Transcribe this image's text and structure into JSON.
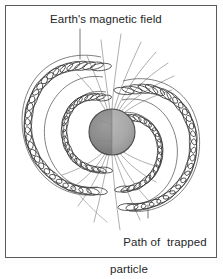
{
  "figure": {
    "title_label": "Earth's magnetic field",
    "path_label_line1": "Path of  trapped",
    "path_label_line2": "particle",
    "colors": {
      "frame": "#5a5a5a",
      "ink": "#3a3a3a",
      "field_line": "#8d8d8d",
      "earth_left": "#878787",
      "earth_right": "#a8a8a8",
      "earth_outline": "#4a4a4a",
      "text": "#262626",
      "background": "#ffffff"
    },
    "earth": {
      "center_x": 112,
      "center_y": 132,
      "radius": 23,
      "name": "Earth"
    },
    "belts": [
      {
        "name": "outer-left-belt",
        "side": "left",
        "size": "outer",
        "loops": 34
      },
      {
        "name": "inner-left-belt",
        "side": "left",
        "size": "inner",
        "loops": 24
      },
      {
        "name": "outer-right-belt",
        "side": "right",
        "size": "outer",
        "loops": 34
      },
      {
        "name": "inner-right-belt",
        "side": "right",
        "size": "inner",
        "loops": 24
      }
    ],
    "field_lines": {
      "north_count": 9,
      "south_count": 9
    },
    "leaders": {
      "top_leader": "vertical line from title label down to outer coil",
      "bottom_leader_vertical": "vertical line from path label up to coil",
      "bottom_leader_curved": "curved line from path label to lower-left field lines"
    }
  }
}
